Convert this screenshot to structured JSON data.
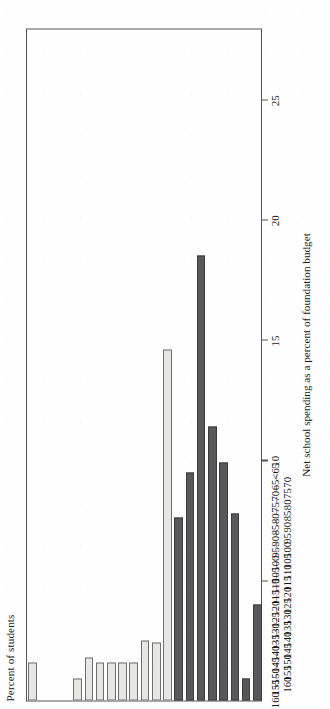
{
  "figure": {
    "orientation": "rotated-90-ccw",
    "background_color": "#fefefe",
    "frame_color": "#55555a"
  },
  "axis_titles": {
    "value_axis": "Percent of students",
    "category_axis": "Net school spending as a percent of foundation budget"
  },
  "value_ticks": [
    "5",
    "10",
    "15",
    "20",
    "25"
  ],
  "colors": {
    "below_foundation": "#58585a",
    "at_or_above_foundation": "#e6e6e2"
  },
  "chart_data": {
    "type": "bar",
    "title": "",
    "xlabel": "Net school spending as a percent of foundation budget",
    "ylabel": "Percent of students",
    "ylim": [
      0,
      28
    ],
    "grid": false,
    "legend": "none",
    "orientation": "vertical-bars-rendered-rotated",
    "categories": [
      "<65",
      "65–\n70",
      "70–\n75",
      "75–\n80",
      "80–\n85",
      "85–\n90",
      "90–\n95",
      "95–\n100",
      "100–\n105",
      "105–\n110",
      "110–\n115",
      "115–\n120",
      "120–\n125",
      "125–\n130",
      "130–\n135",
      "135–\n140",
      "140–\n145",
      "145–\n150",
      "150–\n155",
      "155–\n160",
      "160 +"
    ],
    "values": [
      4.0,
      0.9,
      7.8,
      9.9,
      11.4,
      18.5,
      9.5,
      7.6,
      14.6,
      2.4,
      2.5,
      1.6,
      1.6,
      1.6,
      1.6,
      1.8,
      0.9,
      0.0,
      0.0,
      0.0,
      1.6
    ],
    "bar_group": [
      "low",
      "low",
      "low",
      "low",
      "low",
      "low",
      "low",
      "low",
      "high",
      "high",
      "high",
      "high",
      "high",
      "high",
      "high",
      "high",
      "high",
      "high",
      "high",
      "high",
      "high"
    ]
  },
  "category_labels": [
    {
      "top": "<65",
      "bottom": ""
    },
    {
      "top": "65–",
      "bottom": "70"
    },
    {
      "top": "70–",
      "bottom": "75"
    },
    {
      "top": "75–",
      "bottom": "80"
    },
    {
      "top": "80–",
      "bottom": "85"
    },
    {
      "top": "85–",
      "bottom": "90"
    },
    {
      "top": "90–",
      "bottom": "95"
    },
    {
      "top": "95–",
      "bottom": "100"
    },
    {
      "top": "100–",
      "bottom": "105"
    },
    {
      "top": "105–",
      "bottom": "110"
    },
    {
      "top": "110–",
      "bottom": "115"
    },
    {
      "top": "115–",
      "bottom": "120"
    },
    {
      "top": "120–",
      "bottom": "125"
    },
    {
      "top": "125–",
      "bottom": "130"
    },
    {
      "top": "130–",
      "bottom": "135"
    },
    {
      "top": "135–",
      "bottom": "140"
    },
    {
      "top": "140–",
      "bottom": "145"
    },
    {
      "top": "145–",
      "bottom": "150"
    },
    {
      "top": "150–",
      "bottom": "155"
    },
    {
      "top": "155–",
      "bottom": "160"
    },
    {
      "top": "160 +",
      "bottom": ""
    }
  ]
}
